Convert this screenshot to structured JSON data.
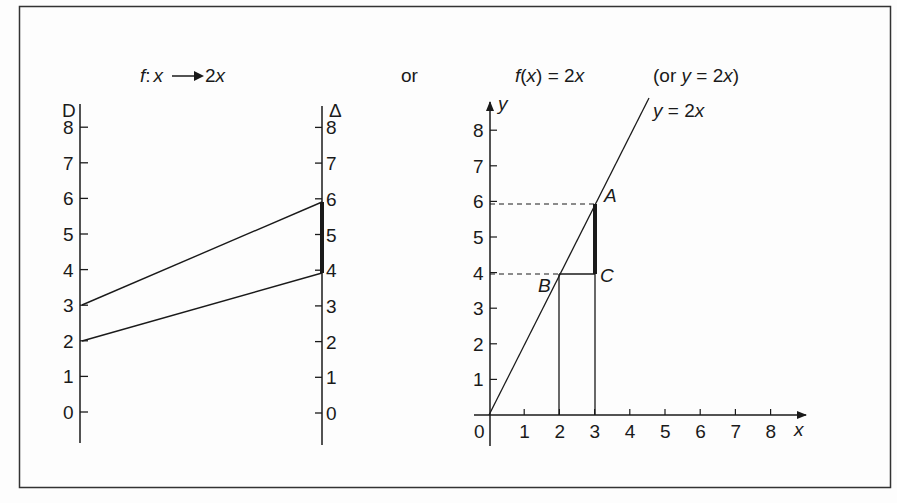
{
  "titles": {
    "mapping": {
      "f": "f",
      "colon": ":",
      "x": "x",
      "arrow_target": "2",
      "arrow_target_var": "x"
    },
    "or": "or",
    "function_notation": {
      "f": "f",
      "open": "(",
      "x": "x",
      "close_eq": ") = 2",
      "var": "x"
    },
    "alt": {
      "open": "(or ",
      "y": "y",
      "eq": " = 2",
      "x": "x",
      "close": ")"
    }
  },
  "mapping_diagram": {
    "domain_label": "D",
    "codomain_label": "Δ",
    "domain_ticks": [
      "0",
      "1",
      "2",
      "3",
      "4",
      "5",
      "6",
      "7",
      "8"
    ],
    "codomain_ticks": [
      "0",
      "1",
      "2",
      "3",
      "4",
      "5",
      "6",
      "7",
      "8"
    ],
    "mappings": [
      {
        "from": 2,
        "to": 4
      },
      {
        "from": 3,
        "to": 6
      }
    ],
    "highlighted_interval": [
      4,
      6
    ]
  },
  "graph": {
    "x_label": "x",
    "y_label": "y",
    "origin_label": "0",
    "x_ticks": [
      "1",
      "2",
      "3",
      "4",
      "5",
      "6",
      "7",
      "8"
    ],
    "y_ticks": [
      "1",
      "2",
      "3",
      "4",
      "5",
      "6",
      "7",
      "8"
    ],
    "line_label": {
      "y": "y",
      "eq": " = 2",
      "x": "x"
    },
    "points": {
      "A": {
        "label": "A",
        "x": 3,
        "y": 6
      },
      "B": {
        "label": "B",
        "x": 2,
        "y": 4
      },
      "C": {
        "label": "C",
        "x": 3,
        "y": 4
      }
    }
  },
  "colors": {
    "ink": "#1a1a1a",
    "background": "#fdfdfd"
  }
}
